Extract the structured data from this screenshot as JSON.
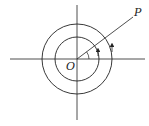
{
  "diagram": {
    "type": "polar-coordinates-figure",
    "labels": {
      "origin": "O",
      "point": "P"
    },
    "colors": {
      "stroke": "#222222",
      "background": "#ffffff"
    },
    "geometry": {
      "center": [
        77,
        59
      ],
      "inner_radius": 22,
      "outer_radius": 35,
      "ray_end": [
        133,
        17
      ]
    }
  }
}
